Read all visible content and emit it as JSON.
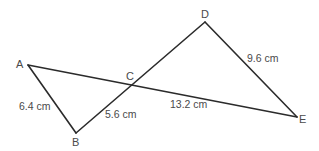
{
  "diagram": {
    "vertices": {
      "A": {
        "label": "A",
        "x": 28,
        "y": 65
      },
      "B": {
        "label": "B",
        "x": 76,
        "y": 133
      },
      "C": {
        "label": "C",
        "x": 132,
        "y": 84
      },
      "D": {
        "label": "D",
        "x": 205,
        "y": 22
      },
      "E": {
        "label": "E",
        "x": 297,
        "y": 117
      }
    },
    "segments": [
      {
        "from": "A",
        "to": "B"
      },
      {
        "from": "B",
        "to": "D"
      },
      {
        "from": "D",
        "to": "E"
      },
      {
        "from": "A",
        "to": "E"
      }
    ],
    "measurements": {
      "AB": "6.4 cm",
      "BC": "5.6 cm",
      "CE": "13.2 cm",
      "DE": "9.6 cm"
    },
    "colors": {
      "line": "#2b2b2b",
      "text": "#4a4a4a",
      "background": "#ffffff"
    }
  }
}
